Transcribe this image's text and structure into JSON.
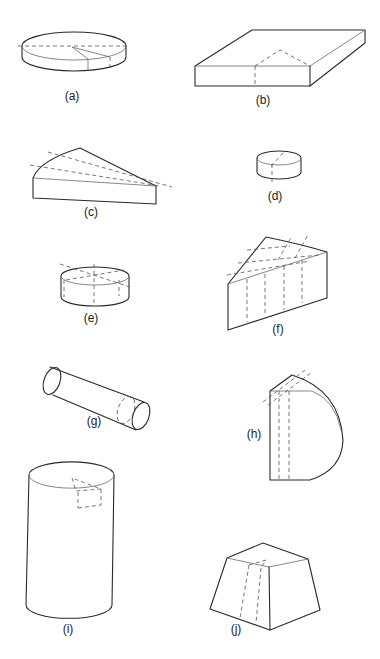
{
  "figure": {
    "page_header": "",
    "panels": [
      {
        "id": "a",
        "label": "(a)",
        "shape": "flat cylinder (disc) with radial sector cut"
      },
      {
        "id": "b",
        "label": "(b)",
        "shape": "flat rectangular slab with triangular dashed section"
      },
      {
        "id": "c",
        "label": "(c)",
        "shape": "circular sector wedge with dashed radial lines"
      },
      {
        "id": "d",
        "label": "(d)",
        "shape": "small cylinder with dashed axis"
      },
      {
        "id": "e",
        "label": "(e)",
        "shape": "short cylinder with crossed dashed diameters"
      },
      {
        "id": "f",
        "label": "(f)",
        "shape": "sector block with dashed grid lines"
      },
      {
        "id": "g",
        "label": "(g)",
        "shape": "horizontal rod cylinder with dashed slice near end"
      },
      {
        "id": "h",
        "label": "(h)",
        "shape": "half-round block with dashed parallel slices"
      },
      {
        "id": "i",
        "label": "(i)",
        "shape": "tall cylinder with dashed wedge at top"
      },
      {
        "id": "j",
        "label": "(j)",
        "shape": "truncated pyramid (frustum) with dashed section"
      }
    ]
  }
}
